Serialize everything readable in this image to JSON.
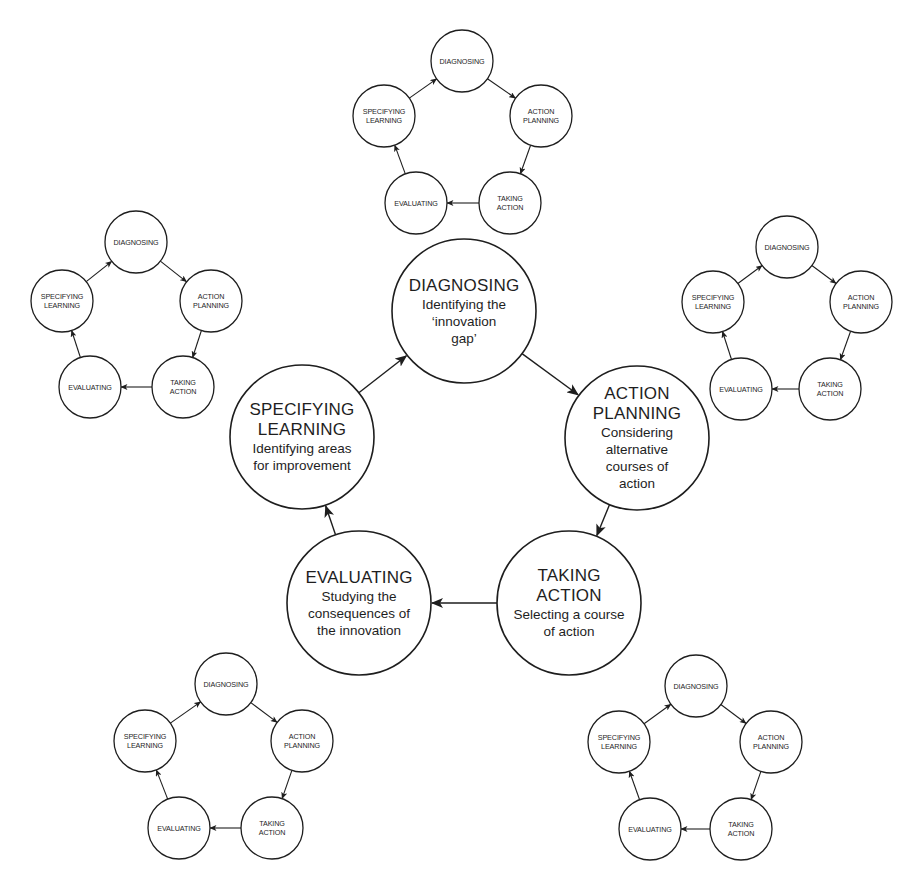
{
  "colors": {
    "stroke": "#1e1e1e",
    "text": "#1e1e1e",
    "background": "#ffffff"
  },
  "main_cycle": {
    "radius": 72,
    "nodes": [
      {
        "id": "diagnosing",
        "cx": 464,
        "cy": 311,
        "title": [
          "DIAGNOSING"
        ],
        "desc": [
          "Identifying the",
          "‘innovation",
          "gap’"
        ]
      },
      {
        "id": "action-planning",
        "cx": 637,
        "cy": 438,
        "title": [
          "ACTION",
          "PLANNING"
        ],
        "desc": [
          "Considering",
          "alternative",
          "courses of",
          "action"
        ]
      },
      {
        "id": "taking-action",
        "cx": 569,
        "cy": 603,
        "title": [
          "TAKING",
          "ACTION"
        ],
        "desc": [
          "Selecting a course",
          "of action"
        ]
      },
      {
        "id": "evaluating",
        "cx": 359,
        "cy": 603,
        "title": [
          "EVALUATING"
        ],
        "desc": [
          "Studying the",
          "consequences of",
          "the innovation"
        ]
      },
      {
        "id": "specifying-learning",
        "cx": 302,
        "cy": 437,
        "title": [
          "SPECIFYING",
          "LEARNING"
        ],
        "desc": [
          "Identifying areas",
          "for improvement"
        ]
      }
    ]
  },
  "small_cycle_labels": [
    [
      "DIAGNOSING"
    ],
    [
      "ACTION",
      "PLANNING"
    ],
    [
      "TAKING",
      "ACTION"
    ],
    [
      "EVALUATING"
    ],
    [
      "SPECIFYING",
      "LEARNING"
    ]
  ],
  "small_cycles": [
    {
      "id": "top",
      "radius": 31,
      "centers": [
        [
          462,
          61
        ],
        [
          541,
          116
        ],
        [
          510,
          203
        ],
        [
          416,
          203
        ],
        [
          384,
          116
        ]
      ]
    },
    {
      "id": "left",
      "radius": 31,
      "centers": [
        [
          136,
          242
        ],
        [
          211,
          301
        ],
        [
          183,
          387
        ],
        [
          90,
          387
        ],
        [
          62,
          301
        ]
      ]
    },
    {
      "id": "right",
      "radius": 31,
      "centers": [
        [
          787,
          247
        ],
        [
          861,
          302
        ],
        [
          830,
          389
        ],
        [
          741,
          389
        ],
        [
          713,
          302
        ]
      ]
    },
    {
      "id": "bottom-left",
      "radius": 31,
      "centers": [
        [
          226,
          684
        ],
        [
          302,
          741
        ],
        [
          272,
          828
        ],
        [
          179,
          828
        ],
        [
          145,
          741
        ]
      ]
    },
    {
      "id": "bottom-right",
      "radius": 31,
      "centers": [
        [
          696,
          686
        ],
        [
          771,
          742
        ],
        [
          741,
          829
        ],
        [
          650,
          829
        ],
        [
          619,
          742
        ]
      ]
    }
  ]
}
